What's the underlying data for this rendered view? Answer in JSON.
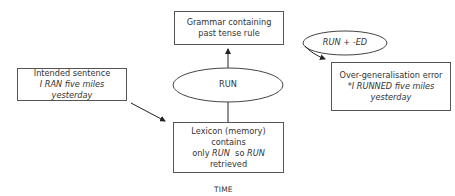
{
  "diagram": {
    "nodes": {
      "grammar": {
        "line1": "Grammar containing",
        "line2": "past tense rule"
      },
      "run_ellipse": {
        "label": "RUN"
      },
      "run_ed_ellipse": {
        "label": "RUN + -ED"
      },
      "intended": {
        "line1": "Intended sentence",
        "line2": "I RAN five miles yesterday"
      },
      "lexicon": {
        "line1": "Lexicon (memory) contains",
        "line2_pre": "only ",
        "line2_it1": "RUN",
        "line2_mid": "  so ",
        "line2_it2": "RUN",
        "line3": "retrieved"
      },
      "overgen": {
        "line1": "Over-generalisation error",
        "line2": "*I RUNNED five miles",
        "line3": "yesterday"
      }
    },
    "edges": [
      {
        "from": "intended",
        "to": "lexicon",
        "arrow": true
      },
      {
        "from": "lexicon",
        "to": "run_ellipse",
        "arrow": false
      },
      {
        "from": "run_ellipse",
        "to": "grammar",
        "arrow": true
      },
      {
        "from": "run_ed_ellipse",
        "to": "overgen",
        "arrow": true
      }
    ],
    "axis_label": "TIME"
  }
}
